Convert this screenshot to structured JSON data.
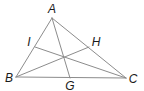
{
  "diagram": {
    "type": "triangle-with-cevians",
    "colors": {
      "line": "#8c8c8c",
      "label": "#1a1a1a",
      "background": "#ffffff"
    },
    "points": {
      "A": {
        "x": 52,
        "y": 18,
        "label": "A",
        "label_x": 52,
        "label_y": 13
      },
      "B": {
        "x": 16,
        "y": 77,
        "label": "B",
        "label_x": 9,
        "label_y": 82
      },
      "C": {
        "x": 126,
        "y": 78,
        "label": "C",
        "label_x": 133,
        "label_y": 83
      },
      "I": {
        "x": 35,
        "y": 47,
        "label": "I",
        "label_x": 29,
        "label_y": 46
      },
      "H": {
        "x": 89,
        "y": 47,
        "label": "H",
        "label_x": 96,
        "label_y": 46
      },
      "G": {
        "x": 70,
        "y": 78,
        "label": "G",
        "label_x": 70,
        "label_y": 90
      }
    },
    "segments": [
      {
        "name": "side-ab",
        "from": "A",
        "to": "B"
      },
      {
        "name": "side-bc",
        "from": "B",
        "to": "C"
      },
      {
        "name": "side-ca",
        "from": "C",
        "to": "A"
      },
      {
        "name": "cevian-ag",
        "from": "A",
        "to": "G"
      },
      {
        "name": "cevian-bh",
        "from": "B",
        "to": "H"
      },
      {
        "name": "cevian-ci",
        "from": "C",
        "to": "I"
      }
    ]
  }
}
